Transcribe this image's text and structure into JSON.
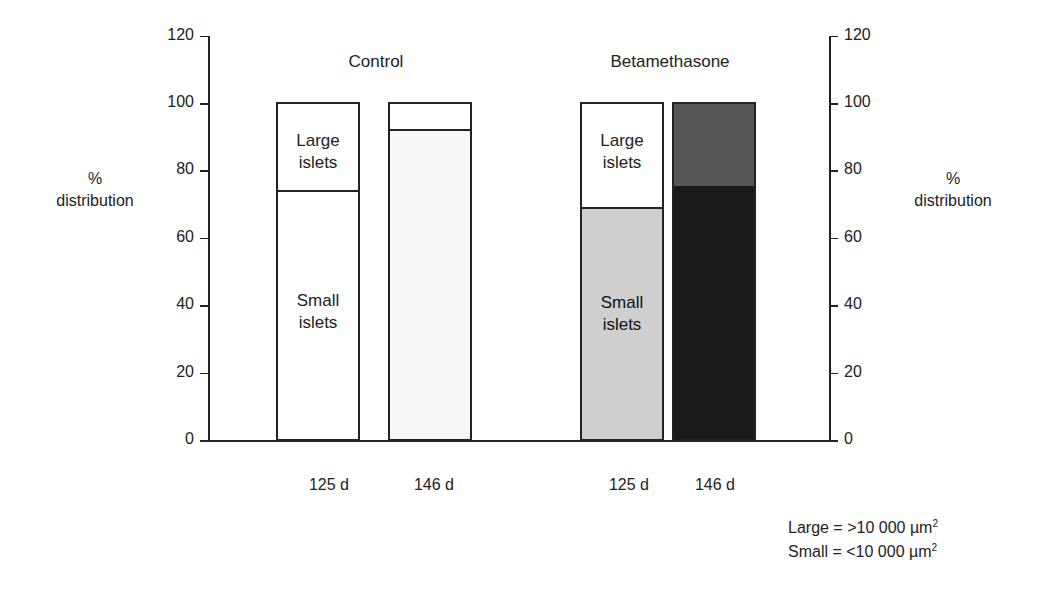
{
  "chart_data": {
    "type": "bar",
    "subtype": "stacked-100",
    "title": "",
    "groups": [
      {
        "name": "Control",
        "categories": [
          "125 d",
          "146 d"
        ]
      },
      {
        "name": "Betamethasone",
        "categories": [
          "125 d",
          "146 d"
        ]
      }
    ],
    "categories": [
      "Control 125 d",
      "Control 146 d",
      "Betamethasone 125 d",
      "Betamethasone 146 d"
    ],
    "series": [
      {
        "name": "Small islets",
        "values": [
          74,
          92,
          69,
          76
        ]
      },
      {
        "name": "Large islets",
        "values": [
          26,
          8,
          31,
          24
        ]
      }
    ],
    "ylabel": "% distribution",
    "ylim": [
      0,
      120
    ],
    "yticks": [
      0,
      20,
      40,
      60,
      80,
      100,
      120
    ],
    "annotations": [
      "Large = >10 000 µm²",
      "Small = <10 000 µm²"
    ]
  },
  "labels": {
    "group_control": "Control",
    "group_beta": "Betamethasone",
    "ylabel_line1": "%",
    "ylabel_line2": "distribution",
    "large_line1": "Large",
    "large_line2": "islets",
    "small_line1": "Small",
    "small_line2": "islets",
    "x1": "125 d",
    "x2": "146 d",
    "x3": "125 d",
    "x4": "146 d",
    "note_large_prefix": "Large = >10 000 µm",
    "note_small_prefix": "Small = <10 000 µm",
    "note_sup": "2"
  },
  "ticks": [
    "0",
    "20",
    "40",
    "60",
    "80",
    "100",
    "120"
  ],
  "colors": {
    "control_fill": "#ffffff",
    "control_146_small": "#f7f7f7",
    "beta_125_small": "#cfcfcf",
    "beta_146_large": "#555555",
    "beta_146_small": "#1a1a1a"
  }
}
